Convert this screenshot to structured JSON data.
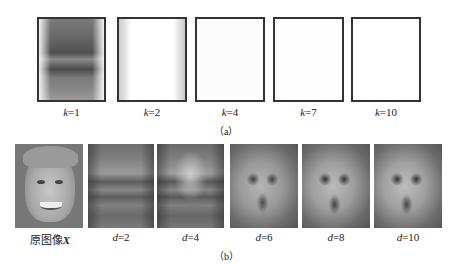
{
  "figure": {
    "panel_a": {
      "caption": "（a）",
      "items": [
        {
          "var": "k",
          "eq": "=1"
        },
        {
          "var": "k",
          "eq": "=2"
        },
        {
          "var": "k",
          "eq": "=4"
        },
        {
          "var": "k",
          "eq": "=7"
        },
        {
          "var": "k",
          "eq": "=10"
        }
      ]
    },
    "panel_b": {
      "caption": "（b）",
      "original_label": "原图像",
      "original_var": "X",
      "items": [
        {
          "var": "d",
          "eq": "=2"
        },
        {
          "var": "d",
          "eq": "=4"
        },
        {
          "var": "d",
          "eq": "=6"
        },
        {
          "var": "d",
          "eq": "=8"
        },
        {
          "var": "d",
          "eq": "=10"
        }
      ]
    }
  }
}
